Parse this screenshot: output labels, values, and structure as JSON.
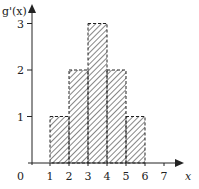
{
  "chart_data": {
    "type": "bar",
    "title": "",
    "xlabel": "x",
    "ylabel": "g'(x)",
    "origin_label": "0",
    "categories": [
      "1-2",
      "2-3",
      "3-4",
      "4-5",
      "5-6"
    ],
    "bins": [
      [
        1,
        2
      ],
      [
        2,
        3
      ],
      [
        3,
        4
      ],
      [
        4,
        5
      ],
      [
        5,
        6
      ]
    ],
    "values": [
      1,
      2,
      3,
      2,
      1
    ],
    "xticks": [
      "1",
      "2",
      "3",
      "4",
      "5",
      "6",
      "7"
    ],
    "yticks": [
      "1",
      "2",
      "3"
    ],
    "xlim": [
      0,
      7.5
    ],
    "ylim": [
      0,
      3.3
    ],
    "grid": false,
    "fill": "diagonal-hatch",
    "edge_style": "dashed"
  },
  "colors": {
    "stroke": "#222222",
    "background": "#ffffff"
  }
}
